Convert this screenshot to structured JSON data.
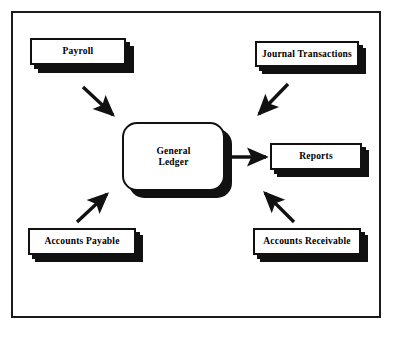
{
  "diagram": {
    "frame": {
      "border_color": "#1a1a1a"
    },
    "colors": {
      "box_fill": "#ffffff",
      "box_border": "#111111",
      "shadow": "#111111",
      "arrow": "#111111",
      "text": "#000000"
    },
    "nodes": {
      "payroll": {
        "label": "Payroll",
        "shape": "rectangle"
      },
      "journal": {
        "label": "Journal Transactions",
        "shape": "rectangle"
      },
      "general_ledger": {
        "label_line1": "General",
        "label_line2": "Ledger",
        "shape": "rounded-rectangle"
      },
      "reports": {
        "label": "Reports",
        "shape": "rectangle"
      },
      "accounts_payable": {
        "label": "Accounts Payable",
        "shape": "rectangle"
      },
      "accounts_receivable": {
        "label": "Accounts Receivable",
        "shape": "rectangle"
      }
    },
    "edges": [
      {
        "from": "payroll",
        "to": "general_ledger",
        "direction": "down-right"
      },
      {
        "from": "journal",
        "to": "general_ledger",
        "direction": "down-left"
      },
      {
        "from": "accounts_payable",
        "to": "general_ledger",
        "direction": "up-right"
      },
      {
        "from": "accounts_receivable",
        "to": "general_ledger",
        "direction": "up-left"
      },
      {
        "from": "general_ledger",
        "to": "reports",
        "direction": "right"
      }
    ]
  }
}
